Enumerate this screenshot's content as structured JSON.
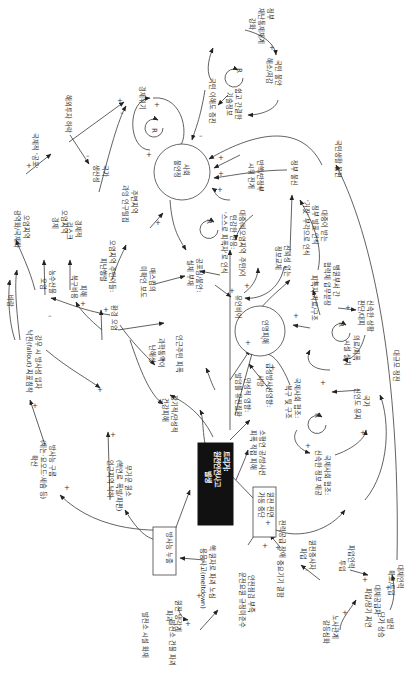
{
  "diagram": {
    "type": "causal-loop-diagram",
    "orientation": "rotated-90-clockwise",
    "colors": {
      "line": "#3a3a3a",
      "central_box": "#111111",
      "central_text": "#ffffff",
      "background": "#ffffff"
    },
    "central": {
      "line1": "트리거:",
      "line2": "원전안전사고",
      "line3": "발생"
    },
    "boxes": {
      "radiation_leak": "방사능 누출",
      "plant_shutdown_l1": "원전 전면",
      "plant_shutdown_l2": "가동 중단"
    },
    "circles": {
      "social_anxiety_l1": "사회",
      "social_anxiety_l2": "불안정",
      "public_distrust": "인명피해"
    },
    "nodes": {
      "econ_crisis": "경제위기",
      "gov_disaster_l1": "정부",
      "gov_disaster_l2": "재난통제체계",
      "gov_disaster_l3": "강화",
      "public_distrust_l1": "국민 불안",
      "public_distrust_l2": "해소/저감",
      "public_understanding": "국민 이해도 증진",
      "info_l1": "쉽고 간결한",
      "info_l2": "기술정보",
      "intl_fear": "국제적 '공포'",
      "foreign_invest": "해외투자 하락",
      "national_prod_l1": "국가",
      "national_prod_l2": "생산성",
      "contam_econ_l1": "오염지역",
      "contam_econ_l2": "경제",
      "econ_risk_l1": "경제적",
      "econ_risk_l2": "리스크",
      "nearby_pop_l1": "주변지역",
      "nearby_pop_l2": "과잉 인구밀집",
      "evac_l1": "오염지역 주민이들:",
      "evac_l2": "피난행렬",
      "rumor_l1": "유언비어",
      "mass_media_l1": "매스컴의",
      "mass_media_l2": "미확인 보도",
      "fear_spread_l1": "공포심/불안:",
      "fear_spread_l2": "실체 부재",
      "activist_l1": "반핵/반정부",
      "activist_l2": "시위 전개",
      "gov_trust_l1": "대중(비오염지역 주민)이",
      "gov_trust_l2": "민감한 반응:",
      "gov_trust_l3": "'스스로 피폭자'로 인식",
      "credible_info_l1": "신뢰성 없는",
      "credible_info_l2": "정보교체",
      "expert_l1": "대중이 받는",
      "expert_l2": "정부 발표 인식",
      "expert_l3": "'거짓' 부각으로 인식",
      "gov_distrust": "정부 불신",
      "medical_l1": "피폭자 치료/구조",
      "hospital_l1": "병원부서 간",
      "hospital_l2": "협력체 업무분장",
      "rapid_l1": "신속한 상황",
      "rapid_l2": "판단/대피",
      "medical_fac_l1": "의료/피폭",
      "medical_fac_l2": "시설 설치",
      "national_life": "국민생활 불편",
      "power_short": "대규모 정전",
      "rescue_l1": "국제사회 협조:",
      "rescue_l2": "복구 및 구조",
      "national_l1": "국가",
      "national_l2": "신인도 유지",
      "support_l1": "국제사회 협조:",
      "support_l2": "신속한 정보 제공",
      "health_l1": "급성방사선영향:",
      "health_l2": "사망",
      "late_effect_l1": "만성적 영향:",
      "late_effect_l2": "발암률 유전질환",
      "acute_l1": "소형연 공/방사선",
      "acute_l2": "피폭 직접 피해",
      "environ": "환경 오염",
      "agri_l1": "농수산물",
      "agri_l2": "오염",
      "damage_l1": "피해",
      "damage_l2": "복구비용",
      "residual_l1": "강우 시 방사성 입자",
      "residual_l2": "낙진(fallout) 지표침착",
      "wind": "바람",
      "deep_damage_l1": "직/간접적인 피해",
      "radiation_cloud_l1": "방사능 구름",
      "radiation_cloud_l2": "(제논·요오드·세슘 등)",
      "radiation_cloud_l3": "확산",
      "area_l1": "오염지역",
      "area_l2": "광역화/국제화",
      "trans_l1": "인근주민 피폭",
      "longterm_l1": "장기적/만성적",
      "longterm_l2": "건강피해",
      "science_l1": "과학통역이",
      "science_l2": "난해성",
      "harmful_l1": "무거운 원소",
      "harmful_l2": "(핵연료 폭발/파편)",
      "harmful_l3": "인근지역 낙하",
      "melt_l1": "핵 원자로 파괴 노심",
      "melt_l2": "용융사고(meltdown)",
      "safety_l1": "안전점검 부족",
      "safety_l2": "운전요원 규정미준수",
      "cooling_l1": "원전 냉각계",
      "cooling_l2": "파괴",
      "coolant_loss_l1": "발전소 시설 화재",
      "coolant_loss_l2": "발전소 건물 파괴",
      "power_fail_l1": "전력공급 장애",
      "defect": "중요기기 결함",
      "stop_l1": "원전종사자",
      "stop_l2": "파업",
      "supply_l1": "대체공급처",
      "supply_l2": "파업/장기 지연",
      "labor_l1": "대체인력",
      "labor_l2": "확보/투입",
      "labor_mgmt_l1": "노사관계",
      "labor_mgmt_l2": "갈등심화",
      "price_l1": "발전",
      "price_l2": "단가 상승",
      "subst_l1": "파업인력",
      "subst_l2": "투입"
    },
    "loop_marker": "R",
    "signs": {
      "plus": "+",
      "minus": "–"
    }
  }
}
